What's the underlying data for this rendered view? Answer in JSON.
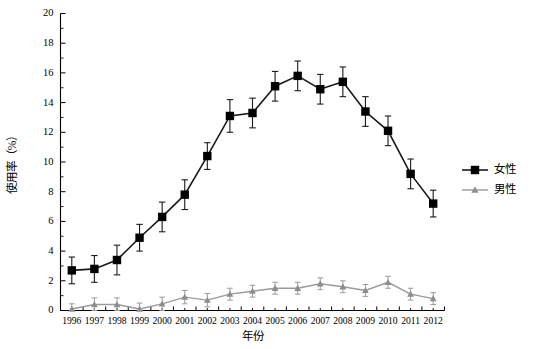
{
  "chart_data": {
    "type": "line",
    "title": "",
    "xlabel": "年份",
    "ylabel": "使用率（%）",
    "xlim": [
      1995.5,
      2012.5
    ],
    "ylim": [
      0,
      20
    ],
    "ytick_step": 2,
    "grid": false,
    "legend_position": "right",
    "categories": [
      "1996",
      "1997",
      "1998",
      "1999",
      "2000",
      "2001",
      "2002",
      "2003",
      "2004",
      "2005",
      "2006",
      "2007",
      "2008",
      "2009",
      "2010",
      "2011",
      "2012"
    ],
    "yticks": [
      "0",
      "2",
      "4",
      "6",
      "8",
      "10",
      "12",
      "14",
      "16",
      "18",
      "20"
    ],
    "series": [
      {
        "name": "女性",
        "marker": "square",
        "color": "#000000",
        "values": [
          2.7,
          2.8,
          3.4,
          4.9,
          6.3,
          7.8,
          10.4,
          13.1,
          13.3,
          15.1,
          15.8,
          14.9,
          15.4,
          13.4,
          12.1,
          9.2,
          7.2
        ],
        "err_low": [
          0.9,
          0.9,
          1.0,
          0.9,
          1.0,
          1.0,
          0.9,
          1.1,
          1.0,
          1.0,
          1.0,
          1.0,
          1.0,
          1.0,
          1.0,
          1.0,
          0.9
        ],
        "err_high": [
          0.9,
          0.9,
          1.0,
          0.9,
          1.0,
          1.0,
          0.9,
          1.1,
          1.0,
          1.0,
          1.0,
          1.0,
          1.0,
          1.0,
          1.0,
          1.0,
          0.9
        ]
      },
      {
        "name": "男性",
        "marker": "triangle",
        "color": "#8d8d8d",
        "values": [
          0.1,
          0.4,
          0.4,
          0.1,
          0.45,
          0.9,
          0.7,
          1.1,
          1.3,
          1.5,
          1.5,
          1.8,
          1.6,
          1.35,
          1.9,
          1.1,
          0.8
        ],
        "err_low": [
          0.1,
          0.4,
          0.4,
          0.1,
          0.45,
          0.45,
          0.45,
          0.4,
          0.4,
          0.4,
          0.4,
          0.4,
          0.4,
          0.4,
          0.4,
          0.4,
          0.4
        ],
        "err_high": [
          0.35,
          0.45,
          0.45,
          0.4,
          0.45,
          0.45,
          0.45,
          0.4,
          0.4,
          0.4,
          0.4,
          0.4,
          0.4,
          0.4,
          0.4,
          0.4,
          0.4
        ]
      }
    ]
  },
  "legend": {
    "items": [
      {
        "label": "女性"
      },
      {
        "label": "男性"
      }
    ]
  }
}
